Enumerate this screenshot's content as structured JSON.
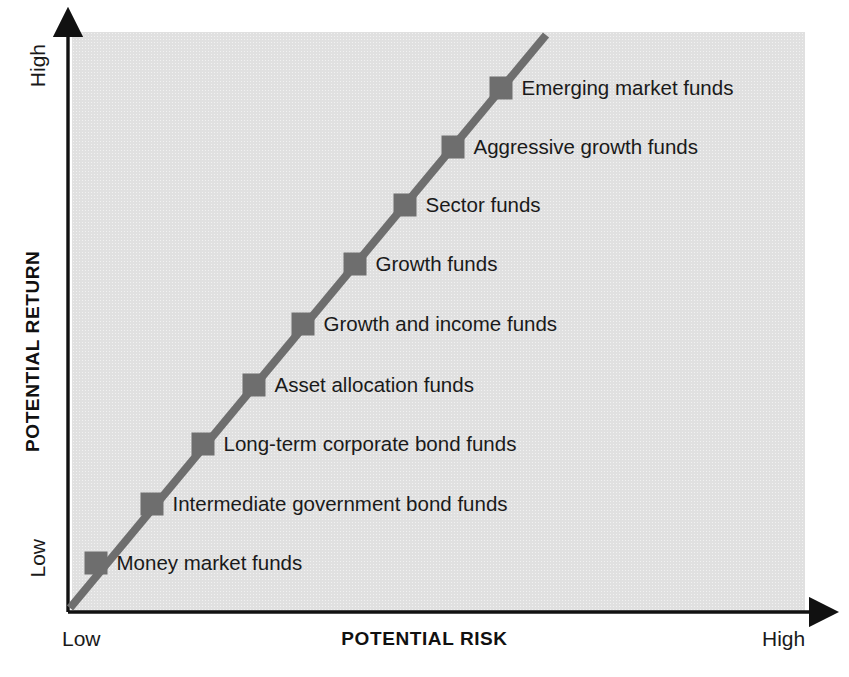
{
  "chart_data": {
    "type": "scatter",
    "title": "",
    "subtitle": "",
    "xlabel": "POTENTIAL RISK",
    "ylabel": "POTENTIAL RETURN",
    "x_tick_labels": [
      "Low",
      "High"
    ],
    "y_tick_labels": [
      "Low",
      "High"
    ],
    "xlim": [
      0,
      10
    ],
    "ylim": [
      0,
      10
    ],
    "grid": false,
    "legend": "none",
    "plot_background_color": "#e0e0e0",
    "marker_color": "#6e6e6e",
    "line_color": "#6e6e6e",
    "axis_color": "#1a1a1a",
    "annotation": "Risk/return spectrum of mutual fund categories arranged along an ascending diagonal line.",
    "categories": [
      "Money market funds",
      "Intermediate government bond funds",
      "Long-term corporate bond funds",
      "Asset allocation funds",
      "Growth and income funds",
      "Growth funds",
      "Sector funds",
      "Aggressive growth funds",
      "Emerging market funds"
    ],
    "points": [
      {
        "label": "Money market funds",
        "risk": 0.6,
        "return": 0.9,
        "px": 96,
        "py": 563
      },
      {
        "label": "Intermediate government bond funds",
        "risk": 1.7,
        "return": 2.0,
        "px": 152,
        "py": 504
      },
      {
        "label": "Long-term corporate bond funds",
        "risk": 2.4,
        "return": 2.9,
        "px": 203,
        "py": 444
      },
      {
        "label": "Asset allocation funds",
        "risk": 3.1,
        "return": 3.9,
        "px": 254,
        "py": 385
      },
      {
        "label": "Growth and income funds",
        "risk": 3.8,
        "return": 5.0,
        "px": 303,
        "py": 324
      },
      {
        "label": "Growth funds",
        "risk": 4.6,
        "return": 6.0,
        "px": 355,
        "py": 264
      },
      {
        "label": "Sector funds",
        "risk": 5.3,
        "return": 7.0,
        "px": 405,
        "py": 205
      },
      {
        "label": "Aggressive growth funds",
        "risk": 6.0,
        "return": 8.0,
        "px": 453,
        "py": 147
      },
      {
        "label": "Emerging market funds",
        "risk": 6.7,
        "return": 9.0,
        "px": 501,
        "py": 88
      }
    ],
    "line": {
      "x_start_px": 70,
      "y_start_px": 608,
      "x_end_px": 546,
      "y_end_px": 35
    }
  },
  "axes": {
    "y": {
      "title": "POTENTIAL RETURN",
      "high_label": "High",
      "low_label": "Low"
    },
    "x": {
      "title": "POTENTIAL RISK",
      "high_label": "High",
      "low_label": "Low"
    }
  },
  "icons": {
    "y_axis_arrow": "arrow-up-icon",
    "x_axis_arrow": "arrow-right-icon"
  }
}
